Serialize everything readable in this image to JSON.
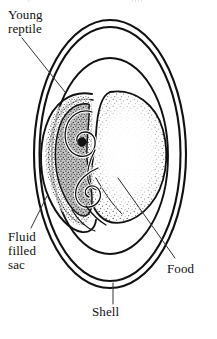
{
  "figure": {
    "kind": "scientific-illustration",
    "background_color": "#ffffff",
    "ink_color": "#111111"
  },
  "labels": {
    "young_reptile": "Young\nreptile",
    "fluid_filled_sac": "Fluid\nfilled\nsac",
    "food": "Food",
    "shell": "Shell"
  },
  "parts": [
    {
      "name": "shell",
      "label": "Shell",
      "description": "outer double-line oval wall of the egg"
    },
    {
      "name": "inner-membrane",
      "label": "",
      "description": "inner oval membrane enclosing embryo and yolk"
    },
    {
      "name": "young-reptile",
      "label": "Young reptile",
      "description": "coiled dark embryo on the left side"
    },
    {
      "name": "fluid-filled-sac",
      "label": "Fluid filled sac",
      "description": "membrane sac surrounding the embryo at lower left"
    },
    {
      "name": "food",
      "label": "Food",
      "description": "large stippled yolk mass filling the right side"
    }
  ],
  "artifact": {
    "top_clipped_text": "y g"
  }
}
